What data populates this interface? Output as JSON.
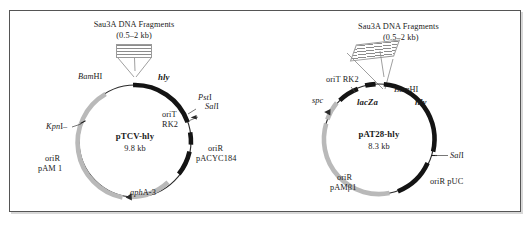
{
  "figure": {
    "border_color": "#555555",
    "background": "#ffffff"
  },
  "plasmids": [
    {
      "id": "pTCV-hly",
      "name": "pTCV-hly",
      "size": "9.8 kb",
      "fragment_header": {
        "enzyme": "Sau3A",
        "text": "DNA Fragments",
        "size_range": "(0.5–2 kb)",
        "style": "horizontal-hatch"
      },
      "features": [
        {
          "label": "BamHI",
          "kind": "site",
          "italic_part": "Bam",
          "roman_part": "HI"
        },
        {
          "label": "hly",
          "kind": "gene",
          "color": "#141414"
        },
        {
          "label": "PstI",
          "kind": "site",
          "italic_part": "Pst",
          "roman_part": "I"
        },
        {
          "label": "SalI",
          "kind": "site",
          "italic_part": "Sal",
          "roman_part": "I"
        },
        {
          "label": "oriT\nRK2",
          "kind": "feature",
          "line1": "oriT",
          "line2": "RK2",
          "color": "#141414"
        },
        {
          "label": "oriR pACYC184",
          "kind": "feature",
          "line1": "oriR",
          "line2": "pACYC184",
          "color": "#141414"
        },
        {
          "label": "aphA-3",
          "kind": "gene",
          "italic_part": "aph",
          "roman_part": "A-3",
          "color": "#b9b9b9"
        },
        {
          "label": "oriR pAM 1",
          "kind": "feature",
          "line1": "oriR",
          "line2": "pAM 1",
          "color": "#b9b9b9"
        },
        {
          "label": "KpnI",
          "kind": "site",
          "italic_part": "Kpn",
          "roman_part": "I"
        }
      ]
    },
    {
      "id": "pAT28-hly",
      "name": "pAT28-hly",
      "size": "8.3 kb",
      "fragment_header": {
        "enzyme": "Sau3A",
        "text": "DNA Fragments",
        "size_range": "(0.5–2 kb)",
        "style": "diagonal-hatch"
      },
      "features": [
        {
          "label": "oriT RK2",
          "kind": "feature",
          "color": "#141414"
        },
        {
          "label": "BamHI",
          "kind": "site",
          "italic_part": "Bam",
          "roman_part": "HI"
        },
        {
          "label": "lacZa",
          "kind": "gene",
          "color": "#141414"
        },
        {
          "label": "hly",
          "kind": "gene",
          "color": "#141414"
        },
        {
          "label": "SalI",
          "kind": "site",
          "italic_part": "Sal",
          "roman_part": "I"
        },
        {
          "label": "oriR pUC",
          "kind": "feature",
          "color": "#141414"
        },
        {
          "label": "spc",
          "kind": "gene",
          "color": "#b9b9b9"
        },
        {
          "label": "oriR pAMβ1",
          "kind": "feature",
          "line1": "oriR",
          "line2": "pAMβ1",
          "color": "#b9b9b9"
        }
      ]
    }
  ],
  "left": {
    "frag_enzyme": "Sau3A",
    "frag_text": " DNA Fragments",
    "frag_size": "(0.5–2 kb)",
    "bamhi_i": "Bam",
    "bamhi_r": "HI",
    "hly": "hly",
    "psti_i": "Pst",
    "psti_r": "I",
    "sali_i": "Sal",
    "sali_r": "I",
    "orit_l1": "oriT",
    "orit_l2": "RK2",
    "orir_acyc_l1": "oriR",
    "orir_acyc_l2": "pACYC184",
    "apha_i": "aph",
    "apha_r": "A-3",
    "orir_pam_l1": "oriR",
    "orir_pam_l2": "pAM 1",
    "kpni_i": "Kpn",
    "kpni_r": "I",
    "title": "pTCV-hly",
    "size": "9.8 kb"
  },
  "right": {
    "frag_enzyme": "Sau3A",
    "frag_text": " DNA Fragments",
    "frag_size": "(0.5–2 kb)",
    "orit": "oriT RK2",
    "bamhi_i": "Bam",
    "bamhi_r": "HI",
    "lacza": "lacZa",
    "hly": "hly",
    "sali_i": "Sal",
    "sali_r": "I",
    "orir_puc": "oriR pUC",
    "spc": "spc",
    "orir_pam_l1": "oriR",
    "orir_pam_l2": "pAMβ1",
    "title": "pAT28-hly",
    "size": "8.3 kb"
  }
}
